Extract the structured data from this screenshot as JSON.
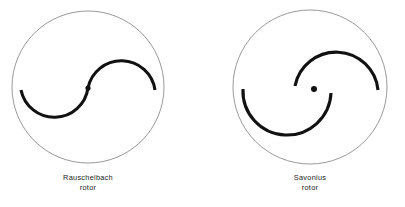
{
  "figure": {
    "background_color": "#ffffff",
    "ink_color": "#111111",
    "outline_color": "#8d8d8d",
    "caption_color": "#222222",
    "panels": [
      {
        "id": "rauschelbach",
        "caption_line1": "Rauschelbach",
        "caption_line2": "rotor",
        "circle": {
          "cx": 88,
          "cy": 87,
          "r": 76
        },
        "hub": {
          "cx": 88,
          "cy": 88,
          "r": 2.6
        },
        "caption_pos": {
          "x": 88,
          "y": 180,
          "line_gap": 10
        },
        "blades": [
          {
            "name": "lower-left-blade",
            "path": "M 21 90 A 34 34 0 0 0 88 88"
          },
          {
            "name": "upper-right-blade",
            "path": "M 88 88 A 34 34 0 0 1 155 90"
          }
        ]
      },
      {
        "id": "savonius",
        "caption_line1": "Savonius",
        "caption_line2": "rotor",
        "circle": {
          "cx": 310,
          "cy": 87,
          "r": 77
        },
        "hub": {
          "cx": 314,
          "cy": 89,
          "r": 3.0
        },
        "caption_pos": {
          "x": 310,
          "y": 180,
          "line_gap": 10
        },
        "blades": [
          {
            "name": "upper-blade",
            "path": "M 295 86 A 42 42 0 0 1 378 90"
          },
          {
            "name": "lower-blade",
            "path": "M 331 93 A 44 44 0 0 1 243 89"
          }
        ]
      }
    ]
  }
}
